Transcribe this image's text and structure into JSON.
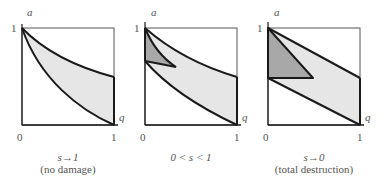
{
  "figure": {
    "colors": {
      "line": "#1a1a1a",
      "frame": "#444444",
      "light_fill": "#e6e6e6",
      "dark_fill": "#a8a8a8",
      "text": "#555555"
    },
    "panels": [
      {
        "id": "no-damage",
        "axis_y_label": "a",
        "axis_x_label": "q",
        "tick_y_top": "1",
        "tick_origin": "0",
        "tick_x_right": "1",
        "caption_line1": "s→1",
        "caption_line2": "(no damage)"
      },
      {
        "id": "partial-damage",
        "axis_y_label": "a",
        "axis_x_label": "q",
        "tick_y_top": "1",
        "tick_origin": "0",
        "tick_x_right": "1",
        "caption_line1": "0 < s < 1",
        "caption_line2": ""
      },
      {
        "id": "total-destruction",
        "axis_y_label": "a",
        "axis_x_label": "q",
        "tick_y_top": "1",
        "tick_origin": "0",
        "tick_x_right": "1",
        "caption_line1": "s→0",
        "caption_line2": "(total destruction)"
      }
    ]
  }
}
